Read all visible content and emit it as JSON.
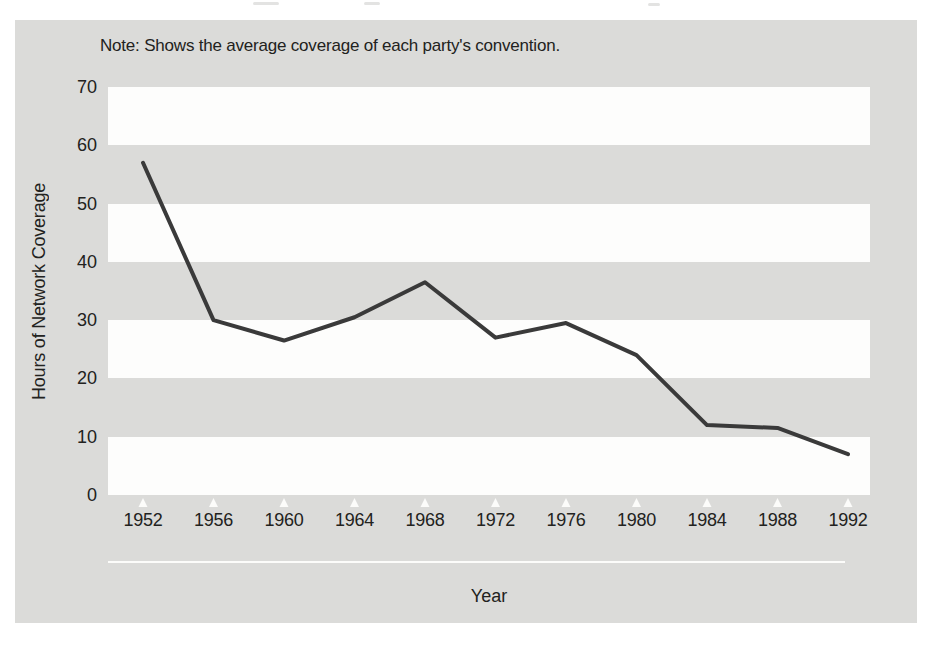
{
  "page": {
    "background": "#ffffff",
    "panel_color": "#dbdbd9",
    "band_color": "#fdfdfc",
    "text_color": "#222220"
  },
  "note": "Note: Shows the average coverage of each party's convention.",
  "chart_data": {
    "type": "line",
    "title": "",
    "xlabel": "Year",
    "ylabel": "Hours of Network Coverage",
    "categories": [
      "1952",
      "1956",
      "1960",
      "1964",
      "1968",
      "1972",
      "1976",
      "1980",
      "1984",
      "1988",
      "1992"
    ],
    "values": [
      57,
      30,
      26.5,
      30.5,
      36.5,
      27,
      29.5,
      24,
      12,
      11.5,
      7
    ],
    "series_name": "Average hours of network convention coverage",
    "yticks": [
      70,
      60,
      50,
      40,
      30,
      20,
      10,
      0
    ],
    "ylim": [
      0,
      70
    ],
    "grid": "alternating horizontal white bands every 10 units on gray panel",
    "legend_position": "none",
    "line_color": "#3a3a3a",
    "line_width": 4,
    "tick_marker": "white upward triangle",
    "tick_marker_color": "#fcfcfa"
  }
}
